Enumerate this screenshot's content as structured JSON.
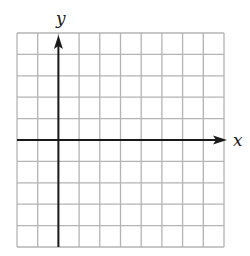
{
  "diagram": {
    "type": "coordinate-grid",
    "grid": {
      "columns": 10,
      "rows": 10,
      "left": 17,
      "top": 33,
      "right": 224,
      "bottom": 247,
      "line_color": "#b4b4b4",
      "line_width": 1.3
    },
    "axes": {
      "color": "#1a1a1a",
      "x_axis": {
        "label": "x",
        "row_index": 5,
        "arrow_tip_x": 227,
        "label_x": 233,
        "label_y": 146
      },
      "y_axis": {
        "label": "y",
        "column_index": 2,
        "arrow_tip_y": 35,
        "label_x": 56,
        "label_y": 24
      }
    }
  }
}
